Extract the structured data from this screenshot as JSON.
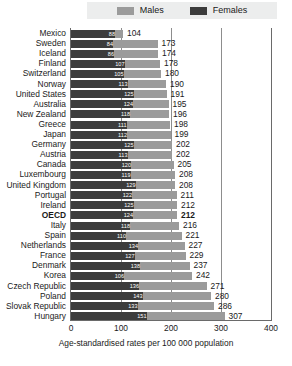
{
  "legend": {
    "items": [
      {
        "label": "Males",
        "color": "#9b9b9b",
        "name": "legend-males"
      },
      {
        "label": "Females",
        "color": "#3c3c3c",
        "name": "legend-females"
      }
    ]
  },
  "axis": {
    "x_label": "Age-standardised rates per 100 000 population",
    "ticks": [
      "0",
      "100",
      "200",
      "300",
      "400"
    ],
    "min": 0,
    "max": 400
  },
  "chart_data": {
    "type": "bar",
    "orientation": "horizontal",
    "title": "",
    "subtitle": "",
    "xlabel": "Age-standardised rates per 100 000 population",
    "ylabel": "",
    "xlim": [
      0,
      400
    ],
    "grid": true,
    "legend_position": "top",
    "categories": [
      "Mexico",
      "Sweden",
      "Iceland",
      "Finland",
      "Switzerland",
      "Norway",
      "United States",
      "Australia",
      "New Zealand",
      "Greece",
      "Japan",
      "Germany",
      "Austria",
      "Canada",
      "Luxembourg",
      "United Kingdom",
      "Portugal",
      "Ireland",
      "OECD",
      "Italy",
      "Spain",
      "Netherlands",
      "France",
      "Denmark",
      "Korea",
      "Czech Republic",
      "Poland",
      "Slovak Republic",
      "Hungary"
    ],
    "series": [
      {
        "name": "Males",
        "color": "#9b9b9b",
        "values": [
          104,
          173,
          174,
          178,
          180,
          190,
          191,
          195,
          196,
          198,
          199,
          202,
          202,
          205,
          208,
          208,
          211,
          212,
          212,
          216,
          221,
          227,
          229,
          237,
          242,
          271,
          280,
          286,
          307
        ]
      },
      {
        "name": "Females",
        "color": "#3c3c3c",
        "values": [
          88,
          84,
          86,
          107,
          105,
          113,
          125,
          124,
          118,
          111,
          112,
          125,
          113,
          120,
          119,
          129,
          122,
          125,
          124,
          118,
          110,
          134,
          127,
          138,
          106,
          136,
          143,
          133,
          151
        ]
      }
    ],
    "total_labels": [
      "104",
      "173",
      "174",
      "178",
      "180",
      "190",
      "191",
      "195",
      "196",
      "198",
      "199",
      "202",
      "202",
      "205",
      "208",
      "208",
      "211",
      "212",
      "212",
      "216",
      "221",
      "227",
      "229",
      "237",
      "242",
      "271",
      "280",
      "286",
      "307"
    ],
    "highlight_category": "OECD"
  }
}
